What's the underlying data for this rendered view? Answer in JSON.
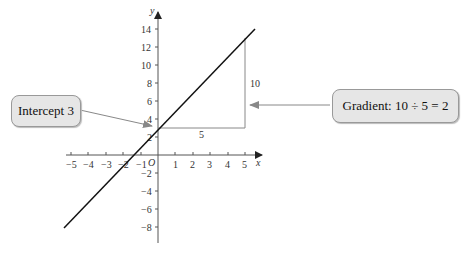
{
  "diagram": {
    "axes": {
      "x_label": "x",
      "y_label": "y",
      "origin_label": "O",
      "x_ticks": [
        "−5",
        "−4",
        "−3",
        "−2",
        "−1",
        "1",
        "2",
        "3",
        "4",
        "5"
      ],
      "y_ticks": [
        "14",
        "12",
        "10",
        "8",
        "6",
        "4",
        "2",
        "−2",
        "−4",
        "−6",
        "−8"
      ]
    },
    "line": {
      "gradient": 2,
      "intercept": 3,
      "color": "#000000"
    },
    "triangle": {
      "rise_label": "10",
      "run_label": "5",
      "color": "#777777"
    },
    "callouts": {
      "intercept": "Intercept 3",
      "gradient": "Gradient: 10 ÷ 5 = 2"
    }
  }
}
